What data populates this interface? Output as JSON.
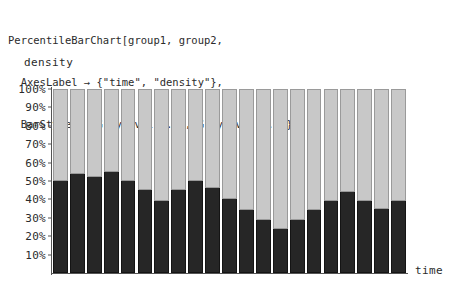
{
  "code": {
    "lines": [
      "PercentileBarChart[group1, group2,",
      "  AxesLabel → {\"time\", \"density\"},",
      "  BarStyle → {GrayLevel[0.4], GrayLevel[0.8]}];"
    ]
  },
  "axes": {
    "y_title": "density",
    "x_title": "time",
    "y_ticks": [
      "100%",
      "90%",
      "80%",
      "70%",
      "60%",
      "50%",
      "40%",
      "30%",
      "20%",
      "10%"
    ],
    "y_tick_values": [
      100,
      90,
      80,
      70,
      60,
      50,
      40,
      30,
      20,
      10
    ]
  },
  "colors": {
    "group1_fill": "#262626",
    "group2_fill": "#c8c8c8",
    "axis": "#555555",
    "background": "#ffffff",
    "text": "#2b2b2b"
  },
  "chart_data": {
    "type": "bar",
    "title": "",
    "subtitle": "",
    "xlabel": "time",
    "ylabel": "density",
    "stacked": true,
    "stack_total_percent": 100,
    "ylim": [
      0,
      100
    ],
    "yunit": "%",
    "grid": false,
    "legend": null,
    "categories": [
      "1",
      "2",
      "3",
      "4",
      "5",
      "6",
      "7",
      "8",
      "9",
      "10",
      "11",
      "12",
      "13",
      "14",
      "15",
      "16",
      "17",
      "18",
      "19",
      "20",
      "21"
    ],
    "series": [
      {
        "name": "group1",
        "style": "GrayLevel[0.4]",
        "color": "#262626",
        "values": [
          50,
          54,
          52,
          55,
          50,
          45,
          39,
          45,
          50,
          46,
          40,
          34,
          29,
          24,
          29,
          34,
          39,
          44,
          39,
          35,
          39
        ]
      },
      {
        "name": "group2",
        "style": "GrayLevel[0.8]",
        "color": "#c8c8c8",
        "values": [
          50,
          46,
          48,
          45,
          50,
          55,
          61,
          55,
          50,
          54,
          60,
          66,
          71,
          76,
          71,
          66,
          61,
          56,
          61,
          65,
          61
        ]
      }
    ]
  }
}
